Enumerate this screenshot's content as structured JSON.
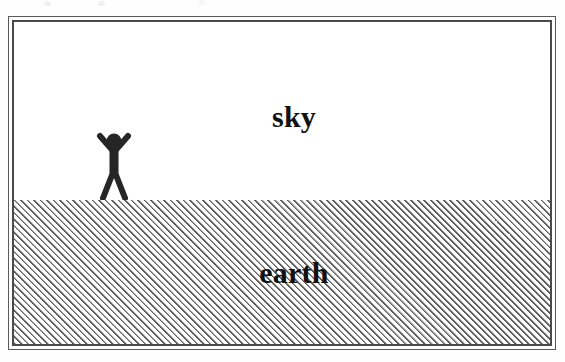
{
  "diagram": {
    "title_visible": false,
    "canvas": {
      "width": 565,
      "height": 362,
      "background": "#fefefe"
    },
    "frame": {
      "style": "double-rule",
      "outer_color": "#5a5a5a",
      "inner_color": "#4a4a4a"
    },
    "regions": [
      {
        "id": "sky",
        "label": "sky",
        "fill": "solid-white",
        "fill_color": "#ffffff",
        "position": "upper"
      },
      {
        "id": "earth",
        "label": "earth",
        "fill": "diagonal-hatch-45",
        "fill_color": "#5e5e5e",
        "position": "lower"
      }
    ],
    "horizon": {
      "label": "horizon-line",
      "y": 199
    },
    "figure": {
      "name": "stick-figure-person",
      "pose": "arms-raised",
      "color": "#262626",
      "standing_on": "earth"
    }
  }
}
